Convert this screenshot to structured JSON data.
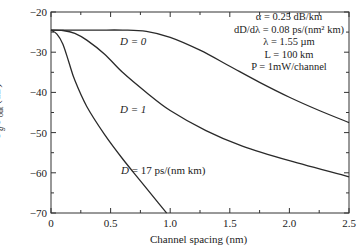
{
  "chart_data": {
    "type": "line",
    "title": "",
    "xlabel": "Channel spacing (nm)",
    "ylabel": "Pg/Pout (dB)",
    "xlim": [
      0,
      2.5
    ],
    "ylim": [
      -70,
      -20
    ],
    "xticks": [
      "0",
      "0.5",
      "1.0",
      "1.5",
      "2.0",
      "2.5"
    ],
    "yticks": [
      "-20",
      "-30",
      "-40",
      "-50",
      "-60",
      "-70"
    ],
    "grid": false,
    "legend": "inline curve labels",
    "series": [
      {
        "name": "D = 0",
        "x": [
          0,
          0.2,
          0.4,
          0.6,
          0.8,
          1.0,
          1.25,
          1.5,
          1.75,
          2.0,
          2.25,
          2.5
        ],
        "values": [
          -24.5,
          -24.5,
          -24.5,
          -24.5,
          -24.8,
          -26.3,
          -29.5,
          -33.5,
          -37.5,
          -41.2,
          -44.5,
          -47.5
        ]
      },
      {
        "name": "D = 1",
        "x": [
          0,
          0.1,
          0.2,
          0.3,
          0.45,
          0.6,
          0.8,
          1.0,
          1.3,
          1.6,
          2.0,
          2.5
        ],
        "values": [
          -24.5,
          -24.6,
          -25.3,
          -27,
          -30.5,
          -35,
          -40,
          -44.5,
          -49.5,
          -53.3,
          -57,
          -61
        ]
      },
      {
        "name": "D = 17 ps/(nm km)",
        "x": [
          0,
          0.05,
          0.1,
          0.15,
          0.2,
          0.3,
          0.45,
          0.6,
          0.75,
          0.9,
          0.97
        ],
        "values": [
          -24.5,
          -25.5,
          -28,
          -32.5,
          -37,
          -43.5,
          -50.5,
          -56.5,
          -62,
          -67.5,
          -70
        ]
      }
    ],
    "annotations": {
      "params": [
        "α = 0.25 dB/km",
        "dD/dλ = 0.08 ps/(nm² km)",
        "λ = 1.55 µm",
        "L = 100 km",
        "P = 1mW/channel"
      ]
    }
  },
  "labels": {
    "d0": "D = 0",
    "d1": "D = 1",
    "d17": "D = 17 ps/(nm km)",
    "xlabel": "Channel spacing (nm)",
    "ylabel_main": "P",
    "ylabel_sub1": "g",
    "ylabel_mid": "/P",
    "ylabel_sub2": "out",
    "ylabel_unit": " (dB)"
  }
}
